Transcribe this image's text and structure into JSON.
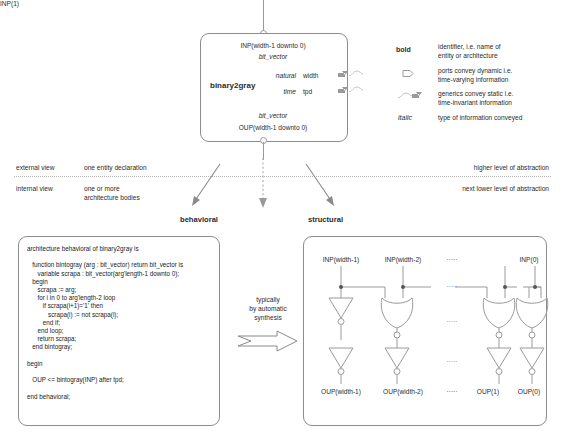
{
  "diagram": {
    "entity": {
      "name": "binary2gray",
      "input_port": "INP(width-1 downto 0)",
      "input_type": "bit_vector",
      "output_type": "bit_vector",
      "output_port": "OUP(width-1 downto 0)",
      "generics": [
        {
          "type": "natural",
          "name": "width"
        },
        {
          "type": "time",
          "name": "tpd"
        }
      ]
    },
    "legend": [
      {
        "key": "bold",
        "style": "bold",
        "desc_line1": "identifier, i.e. name of",
        "desc_line2": "entity or architecture"
      },
      {
        "key": "port-icon",
        "style": "icon",
        "desc_line1": "ports convey dynamic i.e.",
        "desc_line2": "time-varying information"
      },
      {
        "key": "generic-icon",
        "style": "icon",
        "desc_line1": "generics convey static i.e.",
        "desc_line2": "time-invariant information"
      },
      {
        "key": "italic",
        "style": "italic",
        "desc_line1": "type of information conveyed",
        "desc_line2": ""
      }
    ],
    "views": {
      "external_label": "external view",
      "external_desc": "one entity declaration",
      "external_right": "higher level of abstraction",
      "internal_label": "internal view",
      "internal_desc_line1": "one or more",
      "internal_desc_line2": "architecture bodies",
      "internal_right": "next lower level of abstraction"
    },
    "behavioral": {
      "heading": "behavioral",
      "code": "architecture behavioral of binary2gray is\n\n   function bintogray (arg : bit_vector) return bit_vector is\n      variable scrapa : bit_vector(arg'length-1 downto 0);\n   begin\n      scrapa := arg;\n      for i in 0 to arg'length-2 loop\n         if scrapa(i+1)='1' then\n            scrapa(i) := not scrapa(i);\n         end if;\n      end loop;\n      return scrapa;\n   end bintogray;\n\nbegin\n\n   OUP <= bintogray(INP) after tpd;\n\nend behavioral;"
    },
    "synthesis_note": {
      "line1": "typically",
      "line2": "by automatic",
      "line3": "synthesis"
    },
    "structural": {
      "heading": "structural",
      "inputs": [
        "INP(width-1)",
        "INP(width-2)",
        "·····",
        "INP(1)",
        "INP(0)"
      ],
      "outputs": [
        "OUP(width-1)",
        "OUP(width-2)",
        "·····",
        "OUP(1)",
        "OUP(0)"
      ],
      "ellipsis": "·····"
    },
    "colors": {
      "line": "#9a9a9a",
      "text": "#2b2b2b",
      "divider": "#b4b4b4",
      "box_border": "#8d8d8d"
    }
  }
}
